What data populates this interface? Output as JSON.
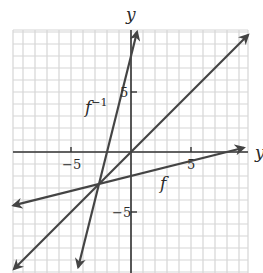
{
  "chart_data": {
    "type": "line",
    "title": "",
    "xlabel": "y",
    "ylabel": "y",
    "xlim": [
      -9.8,
      9.8
    ],
    "ylim": [
      -10.1,
      10.2
    ],
    "grid": true,
    "grid_step": 1,
    "x_ticks": [
      {
        "value": -5,
        "label": "−5"
      },
      {
        "value": 5,
        "label": "5"
      }
    ],
    "y_ticks": [
      {
        "value": 5,
        "label": "5"
      },
      {
        "value": -5,
        "label": "−5"
      }
    ],
    "series": [
      {
        "name": "f",
        "equation": "y = x/4 - 2",
        "slope": 0.25,
        "intercept": -2,
        "x_range": [
          -9.8,
          9.4
        ],
        "label_pos": [
          2.7,
          -2.5
        ]
      },
      {
        "name": "f⁻¹",
        "equation": "y = 4x + 8",
        "slope": 4,
        "intercept": 8,
        "x_range": [
          -4.4,
          0.5
        ],
        "label_pos": [
          -3.6,
          3.6
        ]
      },
      {
        "name": "y = x",
        "equation": "y = x",
        "slope": 1,
        "intercept": 0,
        "x_range": [
          -9.75,
          9.75
        ],
        "label_pos": null
      }
    ]
  },
  "labels": {
    "x_axis": "y",
    "y_axis": "y",
    "f": "f",
    "f_inv_base": "f",
    "f_inv_sup": "−1",
    "tick_x_neg5": "−5",
    "tick_x_5": "5",
    "tick_y_5": "5",
    "tick_y_neg5": "−5"
  },
  "colors": {
    "grid": "#d6d6d6",
    "axis": "#333333",
    "line": "#444444",
    "text": "#2a2a2a"
  }
}
